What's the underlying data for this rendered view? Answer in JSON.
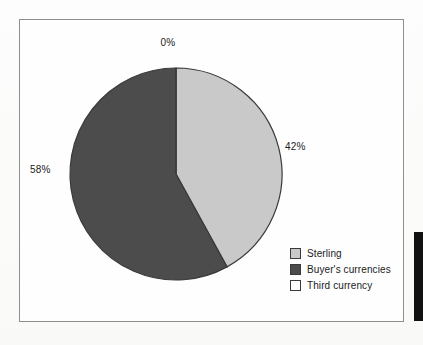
{
  "chart_data": {
    "type": "pie",
    "title": "",
    "categories": [
      "Sterling",
      "Buyer's currencies",
      "Third currency"
    ],
    "values": [
      42,
      58,
      0
    ],
    "value_labels": [
      "42%",
      "58%",
      "0%"
    ],
    "unit": "%",
    "start_angle_deg": 0,
    "direction": "clockwise",
    "legend_position": "bottom-right",
    "grid": false,
    "colors": {
      "sterling": "#c9c9c9",
      "buyers_currencies": "#4c4c4c",
      "third_currency": "#ffffff",
      "slice_outline": "#3a3a3a",
      "frame_border": "#8f8f8f",
      "background": "#fdfdfc",
      "text": "#1b1b1b"
    },
    "slices": [
      {
        "name": "Sterling",
        "value": 42,
        "label": "42%",
        "color": "#c9c9c9"
      },
      {
        "name": "Buyer's currencies",
        "value": 58,
        "label": "58%",
        "color": "#4c4c4c"
      },
      {
        "name": "Third currency",
        "value": 0,
        "label": "0%",
        "color": "#ffffff"
      }
    ]
  },
  "labels": {
    "third_currency_pct": "0%",
    "sterling_pct": "42%",
    "buyers_currencies_pct": "58%"
  },
  "legend": {
    "items": [
      {
        "label": "Sterling",
        "color": "#c9c9c9"
      },
      {
        "label": "Buyer's currencies",
        "color": "#4c4c4c"
      },
      {
        "label": "Third currency",
        "color": "#ffffff"
      }
    ]
  }
}
